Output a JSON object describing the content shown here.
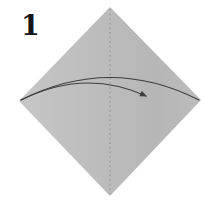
{
  "step": {
    "number": "1"
  },
  "colors": {
    "background": "#ffffff",
    "paper_light": "#c6c6c6",
    "paper": "#bcbcbc",
    "paper_mid": "#b6b6b6",
    "crease": "#8a8a8a",
    "arrow": "#3c3c3c",
    "text": "#141414"
  },
  "icons": {
    "fold_arrow": "curved-fold-arrow",
    "crease_line": "dotted-valley-fold-line",
    "paper": "square-paper-on-point"
  }
}
